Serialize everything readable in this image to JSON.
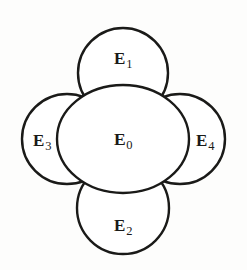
{
  "figure": {
    "background_color": "#fdfdfc",
    "ink_color": "#1a1a18",
    "fill_color": "#ffffff",
    "stroke_width": 2.4,
    "canvas": {
      "width": 247,
      "height": 270
    }
  },
  "sets": [
    {
      "id": "E0",
      "role": "center",
      "base": "E",
      "subscript": "0",
      "label": "E0",
      "shape": "ellipse",
      "cx": 123,
      "cy": 139,
      "rx": 66,
      "ry": 54,
      "label_x": 123,
      "label_y": 140
    },
    {
      "id": "E1",
      "role": "top",
      "base": "E",
      "subscript": "1",
      "label": "E1",
      "shape": "circle",
      "cx": 123,
      "cy": 73,
      "rx": 45,
      "ry": 45,
      "label_x": 123,
      "label_y": 58
    },
    {
      "id": "E2",
      "role": "bottom",
      "base": "E",
      "subscript": "2",
      "label": "E2",
      "shape": "circle",
      "cx": 123,
      "cy": 208,
      "rx": 46,
      "ry": 46,
      "label_x": 123,
      "label_y": 225
    },
    {
      "id": "E3",
      "role": "left",
      "base": "E",
      "subscript": "3",
      "label": "E3",
      "shape": "circle",
      "cx": 67,
      "cy": 139,
      "rx": 45,
      "ry": 45,
      "label_x": 42,
      "label_y": 140
    },
    {
      "id": "E4",
      "role": "right",
      "base": "E",
      "subscript": "4",
      "label": "E4",
      "shape": "circle",
      "cx": 180,
      "cy": 139,
      "rx": 45,
      "ry": 45,
      "label_x": 205,
      "label_y": 140
    }
  ]
}
